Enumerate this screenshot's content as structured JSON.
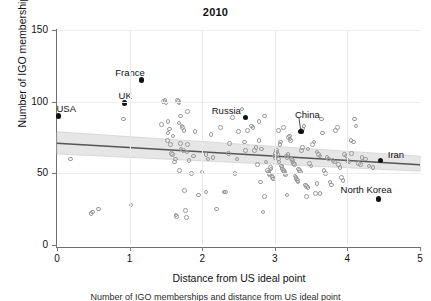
{
  "figure": {
    "title": "2010",
    "caption": "Number of IGO memberships and distance from US ideal point"
  },
  "axes": {
    "xlabel": "Distance from US ideal point",
    "ylabel": "Number of IGO memberships",
    "xticks": [
      "0",
      "1",
      "2",
      "3",
      "4",
      "5"
    ],
    "yticks": [
      "0",
      "50",
      "100",
      "150"
    ]
  },
  "colors": {
    "point_open_stroke": "#9a9a9a",
    "point_highlight": "#121212",
    "fit_line": "#555555",
    "confidence_band": "#d9d9d9",
    "axis": "#6e6e6e",
    "gridline": "#e9e9e9",
    "text": "#111111",
    "background": "#ffffff"
  },
  "chart_data": {
    "type": "scatter",
    "title": "2010",
    "xlabel": "Distance from US ideal point",
    "ylabel": "Number of IGO memberships",
    "xlim": [
      0,
      5
    ],
    "ylim": [
      0,
      150
    ],
    "xticks": [
      0,
      1,
      2,
      3,
      4,
      5
    ],
    "yticks": [
      0,
      50,
      100,
      150
    ],
    "grid": "faint vertical gridlines at integer x and horizontal at y ticks",
    "legend": "none",
    "fit_line": {
      "label": "linear fit with confidence band",
      "x": [
        0.0,
        5.0
      ],
      "y": [
        71.0,
        56.0
      ],
      "band_lower": [
        63.5,
        51.5
      ],
      "band_upper": [
        79.0,
        62.0
      ]
    },
    "highlighted": [
      {
        "label": "USA",
        "x": 0.02,
        "y": 90,
        "label_dx": -2,
        "label_dy": -12
      },
      {
        "label": "UK",
        "x": 0.93,
        "y": 99,
        "label_dx": -6,
        "label_dy": -12
      },
      {
        "label": "France",
        "x": 1.16,
        "y": 115,
        "label_dx": -26,
        "label_dy": -12
      },
      {
        "label": "Russia",
        "x": 2.6,
        "y": 89,
        "label_dx": -34,
        "label_dy": -11
      },
      {
        "label": "China",
        "x": 3.36,
        "y": 79,
        "label_dx": -6,
        "label_dy": -22,
        "leader": true
      },
      {
        "label": "Iran",
        "x": 4.46,
        "y": 59,
        "label_dx": 7,
        "label_dy": -10
      },
      {
        "label": "North Korea",
        "x": 4.43,
        "y": 32,
        "label_dx": -38,
        "label_dy": -14
      }
    ],
    "points": [
      [
        0.19,
        60
      ],
      [
        0.47,
        22
      ],
      [
        0.49,
        23
      ],
      [
        0.57,
        25
      ],
      [
        0.92,
        88
      ],
      [
        1.02,
        28
      ],
      [
        1.44,
        84
      ],
      [
        1.47,
        100
      ],
      [
        1.49,
        101
      ],
      [
        1.5,
        99
      ],
      [
        1.52,
        73
      ],
      [
        1.53,
        78
      ],
      [
        1.55,
        81
      ],
      [
        1.56,
        70
      ],
      [
        1.58,
        64
      ],
      [
        1.59,
        63
      ],
      [
        1.6,
        76
      ],
      [
        1.62,
        58
      ],
      [
        1.63,
        60
      ],
      [
        1.64,
        21
      ],
      [
        1.65,
        20
      ],
      [
        1.66,
        101
      ],
      [
        1.67,
        100
      ],
      [
        1.68,
        99
      ],
      [
        1.69,
        52
      ],
      [
        1.7,
        90
      ],
      [
        1.71,
        67
      ],
      [
        1.72,
        83
      ],
      [
        1.73,
        82
      ],
      [
        1.74,
        66
      ],
      [
        1.75,
        80
      ],
      [
        1.76,
        38
      ],
      [
        1.77,
        24
      ],
      [
        1.78,
        19
      ],
      [
        1.79,
        65
      ],
      [
        1.8,
        93
      ],
      [
        1.82,
        59
      ],
      [
        1.85,
        50
      ],
      [
        1.88,
        62
      ],
      [
        1.9,
        79
      ],
      [
        2.0,
        51
      ],
      [
        2.05,
        63
      ],
      [
        2.08,
        60
      ],
      [
        2.12,
        77
      ],
      [
        2.15,
        61
      ],
      [
        2.2,
        25
      ],
      [
        2.25,
        82
      ],
      [
        2.3,
        37
      ],
      [
        2.32,
        37
      ],
      [
        2.38,
        71
      ],
      [
        2.45,
        50
      ],
      [
        2.5,
        79
      ],
      [
        2.55,
        95
      ],
      [
        2.58,
        72
      ],
      [
        2.62,
        80
      ],
      [
        2.68,
        83
      ],
      [
        2.7,
        82
      ],
      [
        2.72,
        66
      ],
      [
        2.74,
        68
      ],
      [
        2.76,
        56
      ],
      [
        2.78,
        73
      ],
      [
        2.8,
        44
      ],
      [
        2.82,
        67
      ],
      [
        2.84,
        23
      ],
      [
        2.86,
        90
      ],
      [
        2.88,
        58
      ],
      [
        2.9,
        52
      ],
      [
        2.91,
        51
      ],
      [
        2.92,
        50
      ],
      [
        2.93,
        49
      ],
      [
        2.94,
        54
      ],
      [
        2.95,
        53
      ],
      [
        2.96,
        48
      ],
      [
        2.97,
        47
      ],
      [
        2.98,
        46
      ],
      [
        2.99,
        62
      ],
      [
        3.0,
        61
      ],
      [
        3.01,
        64
      ],
      [
        3.02,
        66
      ],
      [
        3.03,
        65
      ],
      [
        3.04,
        63
      ],
      [
        3.05,
        60
      ],
      [
        3.06,
        58
      ],
      [
        3.07,
        70
      ],
      [
        3.08,
        72
      ],
      [
        3.09,
        55
      ],
      [
        3.1,
        54
      ],
      [
        3.11,
        53
      ],
      [
        3.12,
        52
      ],
      [
        3.13,
        51
      ],
      [
        3.14,
        50
      ],
      [
        3.15,
        49
      ],
      [
        3.16,
        62
      ],
      [
        3.17,
        61
      ],
      [
        3.18,
        63
      ],
      [
        3.19,
        75
      ],
      [
        3.2,
        76
      ],
      [
        3.21,
        74
      ],
      [
        3.22,
        73
      ],
      [
        3.23,
        60
      ],
      [
        3.24,
        59
      ],
      [
        3.25,
        58
      ],
      [
        3.26,
        57
      ],
      [
        3.27,
        56
      ],
      [
        3.28,
        48
      ],
      [
        3.29,
        47
      ],
      [
        3.3,
        46
      ],
      [
        3.31,
        45
      ],
      [
        3.32,
        44
      ],
      [
        3.33,
        53
      ],
      [
        3.34,
        52
      ],
      [
        3.35,
        51
      ],
      [
        3.37,
        66
      ],
      [
        3.38,
        68
      ],
      [
        3.39,
        81
      ],
      [
        3.4,
        83
      ],
      [
        3.42,
        42
      ],
      [
        3.44,
        41
      ],
      [
        3.46,
        40
      ],
      [
        3.48,
        57
      ],
      [
        3.5,
        55
      ],
      [
        3.52,
        70
      ],
      [
        3.54,
        72
      ],
      [
        3.56,
        36
      ],
      [
        3.58,
        43
      ],
      [
        3.6,
        63
      ],
      [
        3.62,
        62
      ],
      [
        3.64,
        88
      ],
      [
        3.66,
        78
      ],
      [
        3.68,
        52
      ],
      [
        3.7,
        50
      ],
      [
        3.72,
        61
      ],
      [
        3.74,
        60
      ],
      [
        3.76,
        44
      ],
      [
        3.78,
        42
      ],
      [
        3.8,
        59
      ],
      [
        3.82,
        58
      ],
      [
        3.84,
        80
      ],
      [
        3.86,
        82
      ],
      [
        3.88,
        56
      ],
      [
        3.9,
        54
      ],
      [
        3.92,
        47
      ],
      [
        3.94,
        45
      ],
      [
        3.96,
        63
      ],
      [
        3.98,
        62
      ],
      [
        4.0,
        59
      ],
      [
        4.02,
        58
      ],
      [
        4.05,
        73
      ],
      [
        4.08,
        72
      ],
      [
        4.1,
        88
      ],
      [
        4.12,
        83
      ],
      [
        4.15,
        57
      ],
      [
        4.18,
        56
      ],
      [
        4.2,
        61
      ],
      [
        4.25,
        60
      ],
      [
        4.3,
        55
      ],
      [
        4.35,
        54
      ],
      [
        2.42,
        89
      ],
      [
        2.86,
        34
      ],
      [
        3.17,
        35
      ],
      [
        3.44,
        34
      ],
      [
        3.62,
        36
      ],
      [
        1.95,
        35
      ],
      [
        2.05,
        37
      ],
      [
        3.05,
        80
      ],
      [
        3.12,
        82
      ],
      [
        2.78,
        86
      ],
      [
        1.53,
        86
      ],
      [
        1.68,
        85
      ],
      [
        1.7,
        71
      ],
      [
        1.8,
        70
      ],
      [
        2.36,
        64
      ],
      [
        2.48,
        60
      ],
      [
        2.6,
        66
      ],
      [
        3.46,
        67
      ],
      [
        3.58,
        65
      ],
      [
        4.06,
        64
      ]
    ]
  }
}
